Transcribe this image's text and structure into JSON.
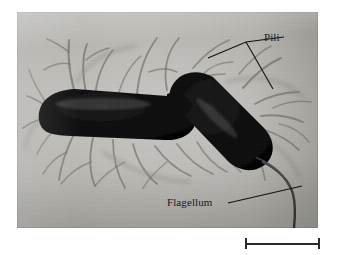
{
  "figure": {
    "kind": "electron-micrograph",
    "background_color": "#ffffff",
    "plate_color": "#c0bfbb",
    "cell_color": "#0b0b0b",
    "appendage_color": "#5b5a57",
    "annotation_color": "#111111"
  },
  "micrograph": {
    "left": 17,
    "top": 12,
    "width": 301,
    "height": 216
  },
  "labels": [
    {
      "id": "pili",
      "text": "Pili",
      "x": 264,
      "y": 31,
      "leader_kind": "forked",
      "leader_points": "284,37 246,42 208,58",
      "leader_points_2": "246,42 273,89"
    },
    {
      "id": "flagellum",
      "text": "Flagellum",
      "x": 167,
      "y": 196,
      "leader_kind": "straight",
      "leader_points": "228,203 302,186"
    }
  ],
  "scale_bar": {
    "label": "",
    "x": 245,
    "y": 238,
    "width": 75,
    "color": "#2a2a2a"
  },
  "structures": {
    "cell_left": {
      "name": "bacterium-left",
      "orientation": "horizontal rod"
    },
    "cell_right": {
      "name": "bacterium-right",
      "orientation": "diagonal rod"
    },
    "pili": {
      "name": "pili",
      "count_visible": "many, radiating from both cells"
    },
    "flagellum": {
      "name": "flagellum",
      "count_visible": "one, trailing to lower right"
    }
  }
}
